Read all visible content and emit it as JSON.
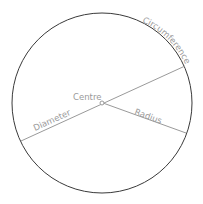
{
  "diagram": {
    "labels": {
      "circumference": "Circumference",
      "centre": "Centre",
      "radius": "Radius",
      "diameter": "Diameter"
    },
    "colors": {
      "circle_stroke": "#3a3a3a",
      "line_stroke": "#9a9a9a",
      "label_text": "#9a9a9a",
      "background": "#ffffff"
    },
    "geometry": {
      "centre": [
        102,
        103
      ],
      "radius": 90,
      "diameter_endpoints": [
        [
          21,
          141
        ],
        [
          185,
          66
        ]
      ],
      "radius_endpoint": [
        186,
        133
      ]
    }
  }
}
